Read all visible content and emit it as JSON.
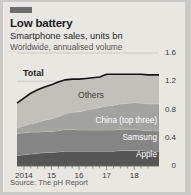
{
  "card": {
    "accent_color": "#6e6e6e",
    "background": "#e9e7e2",
    "title": "Low battery",
    "subtitle": "Smartphone sales, units bn",
    "subtitle2": "Worldwide, annualised volume",
    "source": "Source: The pH Report"
  },
  "chart_data": {
    "type": "area",
    "title": "Low battery",
    "subtitle": "Smartphone sales, units bn",
    "note": "Worldwide, annualised volume",
    "source": "Source: The pH Report",
    "stacked": true,
    "xlabel": "",
    "ylabel": "units bn",
    "ylim": [
      0,
      1.6
    ],
    "yticks": [
      "0",
      "0.4",
      "0.8",
      "1.2",
      "1.6"
    ],
    "ytick_values": [
      0,
      0.4,
      0.8,
      1.2,
      1.6
    ],
    "xticks": [
      "2014",
      "15",
      "16",
      "17",
      "18"
    ],
    "xtick_values": [
      2014,
      2015,
      2016,
      2017,
      2018
    ],
    "xlim": [
      2013.75,
      2018.9
    ],
    "grid": true,
    "legend": "in-chart labels",
    "x": [
      2013.75,
      2014.0,
      2014.25,
      2014.5,
      2014.75,
      2015.0,
      2015.25,
      2015.5,
      2015.75,
      2016.0,
      2016.25,
      2016.5,
      2016.75,
      2017.0,
      2017.25,
      2017.5,
      2017.75,
      2018.0,
      2018.25,
      2018.5,
      2018.9
    ],
    "series": [
      {
        "name": "Apple",
        "color": "#565656",
        "label": "Apple",
        "values": [
          0.15,
          0.16,
          0.17,
          0.18,
          0.19,
          0.19,
          0.2,
          0.21,
          0.21,
          0.21,
          0.21,
          0.21,
          0.21,
          0.21,
          0.21,
          0.22,
          0.22,
          0.22,
          0.22,
          0.21,
          0.21
        ]
      },
      {
        "name": "Samsung",
        "color": "#858585",
        "label": "Samsung",
        "values": [
          0.31,
          0.31,
          0.31,
          0.3,
          0.3,
          0.3,
          0.3,
          0.31,
          0.31,
          0.3,
          0.3,
          0.3,
          0.3,
          0.3,
          0.3,
          0.3,
          0.3,
          0.3,
          0.29,
          0.29,
          0.29
        ]
      },
      {
        "name": "China (top three)",
        "color": "#a3a3a0",
        "label": "China (top three)",
        "values": [
          0.08,
          0.1,
          0.12,
          0.14,
          0.16,
          0.18,
          0.2,
          0.22,
          0.24,
          0.26,
          0.28,
          0.3,
          0.32,
          0.34,
          0.35,
          0.36,
          0.37,
          0.38,
          0.38,
          0.38,
          0.38
        ]
      },
      {
        "name": "Others",
        "color": "#c2c0bb",
        "label": "Others",
        "values": [
          0.35,
          0.39,
          0.43,
          0.46,
          0.47,
          0.48,
          0.49,
          0.48,
          0.47,
          0.46,
          0.45,
          0.44,
          0.43,
          0.45,
          0.44,
          0.42,
          0.41,
          0.4,
          0.41,
          0.41,
          0.41
        ]
      }
    ],
    "total_line": {
      "name": "Total",
      "label": "Total",
      "color": "#141414",
      "values": [
        0.89,
        0.96,
        1.03,
        1.08,
        1.12,
        1.15,
        1.19,
        1.22,
        1.23,
        1.23,
        1.24,
        1.25,
        1.26,
        1.3,
        1.3,
        1.3,
        1.3,
        1.3,
        1.3,
        1.29,
        1.29
      ]
    }
  }
}
